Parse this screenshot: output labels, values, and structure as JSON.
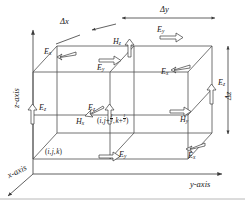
{
  "figure": {
    "type": "yee-cell-diagram",
    "background": "#ffffff",
    "line_color": "#4a4a4a",
    "text_color": "#1a1a1a"
  },
  "axes": {
    "x": {
      "label": "x-axis",
      "direction": "down-left"
    },
    "y": {
      "label": "y-axis",
      "direction": "right"
    },
    "z": {
      "label": "z-axis",
      "direction": "up"
    }
  },
  "dimensions": [
    {
      "id": "dx",
      "label": "Δx",
      "orientation": "depth-diagonal",
      "position": "top-left"
    },
    {
      "id": "dy",
      "label": "Δy",
      "orientation": "horizontal",
      "position": "top"
    },
    {
      "id": "dz",
      "label": "Δz",
      "orientation": "vertical",
      "position": "right"
    }
  ],
  "node_labels": [
    {
      "id": "origin-node",
      "text_parts": {
        "open": "(",
        "i": "i",
        "sep1": ", ",
        "j": "j",
        "sep2": ", ",
        "k": "k",
        "close": ")"
      },
      "text": "(i, j, k)",
      "position": "bottom-left-front-corner"
    },
    {
      "id": "hx-node",
      "text": "(i, j+½, k+½)",
      "position": "cell-face-center-front"
    }
  ],
  "field_components": [
    {
      "id": "e-x-top-left",
      "symbol": "E",
      "sub": "x",
      "type": "E",
      "axis": "x",
      "arrow": "hollow",
      "note": "top rear-left edge"
    },
    {
      "id": "h-z-top",
      "symbol": "H",
      "sub": "z",
      "type": "H",
      "axis": "z",
      "arrow": "hollow",
      "note": "top face center, pointing up"
    },
    {
      "id": "e-y-top-right",
      "symbol": "E",
      "sub": "y",
      "type": "E",
      "axis": "y",
      "arrow": "hollow",
      "note": "top rear edge, pointing right"
    },
    {
      "id": "e-y-top-mid",
      "symbol": "E",
      "sub": "y",
      "type": "E",
      "axis": "y",
      "arrow": "hollow",
      "note": "top front edge, pointing right"
    },
    {
      "id": "e-x-right-upper",
      "symbol": "E",
      "sub": "x",
      "type": "E",
      "axis": "x",
      "arrow": "hollow",
      "note": "upper right edge, pointing down-left"
    },
    {
      "id": "e-z-right",
      "symbol": "E",
      "sub": "z",
      "type": "E",
      "axis": "z",
      "arrow": "hollow",
      "note": "right rear vertical edge, pointing up"
    },
    {
      "id": "e-z-left",
      "symbol": "E",
      "sub": "z",
      "type": "E",
      "axis": "z",
      "arrow": "hollow",
      "note": "left front vertical edge, pointing up"
    },
    {
      "id": "e-z-mid",
      "symbol": "E",
      "sub": "z",
      "type": "E",
      "axis": "z",
      "arrow": "hollow",
      "note": "center vertical edge, pointing up"
    },
    {
      "id": "h-x-front",
      "symbol": "H",
      "sub": "x",
      "type": "H",
      "axis": "x",
      "arrow": "hollow",
      "note": "front face center, pointing down-left"
    },
    {
      "id": "h-y-right",
      "symbol": "H",
      "sub": "y",
      "type": "H",
      "axis": "y",
      "arrow": "hollow",
      "note": "right face center, pointing right"
    },
    {
      "id": "e-y-bottom",
      "symbol": "E",
      "sub": "y",
      "type": "E",
      "axis": "y",
      "arrow": "hollow",
      "note": "bottom front edge, pointing right"
    },
    {
      "id": "e-x-bottom",
      "symbol": "E",
      "sub": "x",
      "type": "E",
      "axis": "x",
      "arrow": "hollow",
      "note": "bottom right edge, pointing down-left"
    }
  ]
}
